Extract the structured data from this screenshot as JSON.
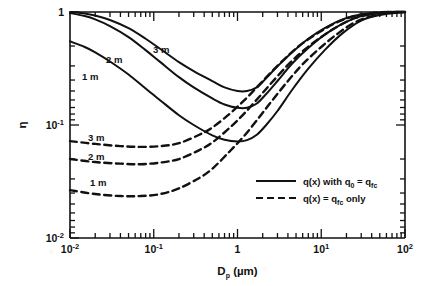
{
  "figure": {
    "background_color": "#ffffff",
    "ink_color": "#111111"
  },
  "chart_data": {
    "type": "line",
    "title": "",
    "subtitle": "",
    "xlabel": "D_p (µm)",
    "ylabel": "η",
    "xscale": "log",
    "yscale": "log",
    "xlim": [
      0.01,
      100
    ],
    "ylim": [
      0.01,
      1
    ],
    "grid": false,
    "legend_position": "lower-right-inside",
    "xtick_labels": [
      "10⁻²",
      "10⁻¹",
      "1",
      "10¹",
      "10²"
    ],
    "xtick_values": [
      0.01,
      0.1,
      1,
      10,
      100
    ],
    "ytick_labels": [
      "10⁻²",
      "10⁻¹",
      "1"
    ],
    "ytick_values": [
      0.01,
      0.1,
      1
    ],
    "series": [
      {
        "name": "3 m",
        "style": "solid",
        "group": "q(x) with q0 = qfc",
        "label": "3 m",
        "x": [
          0.01,
          0.015,
          0.02,
          0.03,
          0.05,
          0.08,
          0.12,
          0.2,
          0.3,
          0.5,
          0.7,
          1.0,
          1.3,
          1.7,
          2.2,
          3.0,
          4.5,
          7.0,
          11,
          18,
          30,
          50,
          100
        ],
        "y": [
          1.0,
          0.97,
          0.93,
          0.85,
          0.72,
          0.58,
          0.47,
          0.36,
          0.3,
          0.245,
          0.215,
          0.2,
          0.2,
          0.215,
          0.26,
          0.33,
          0.44,
          0.58,
          0.72,
          0.86,
          0.95,
          0.99,
          1.0
        ]
      },
      {
        "name": "2 m",
        "style": "solid",
        "group": "q(x) with q0 = qfc",
        "label": "2 m",
        "x": [
          0.01,
          0.015,
          0.02,
          0.03,
          0.05,
          0.08,
          0.12,
          0.2,
          0.3,
          0.5,
          0.7,
          1.0,
          1.3,
          1.7,
          2.2,
          3.0,
          4.5,
          7.0,
          11,
          18,
          30,
          50,
          100
        ],
        "y": [
          0.98,
          0.92,
          0.86,
          0.75,
          0.6,
          0.46,
          0.36,
          0.265,
          0.215,
          0.172,
          0.152,
          0.142,
          0.142,
          0.155,
          0.188,
          0.245,
          0.35,
          0.48,
          0.63,
          0.79,
          0.92,
          0.975,
          1.0
        ]
      },
      {
        "name": "1 m",
        "style": "solid",
        "group": "q(x) with q0 = qfc",
        "label": "1 m",
        "x": [
          0.01,
          0.015,
          0.02,
          0.03,
          0.05,
          0.08,
          0.12,
          0.2,
          0.3,
          0.5,
          0.7,
          1.0,
          1.3,
          1.7,
          2.2,
          3.0,
          4.5,
          7.0,
          11,
          18,
          30,
          50,
          100
        ],
        "y": [
          0.55,
          0.49,
          0.44,
          0.365,
          0.28,
          0.21,
          0.165,
          0.122,
          0.1,
          0.081,
          0.074,
          0.0715,
          0.0735,
          0.082,
          0.1,
          0.133,
          0.205,
          0.315,
          0.46,
          0.65,
          0.84,
          0.94,
          1.0
        ]
      },
      {
        "name": "3 m",
        "style": "dashed",
        "group": "q(x) = qfc only",
        "label": "3 m",
        "x": [
          0.01,
          0.02,
          0.04,
          0.07,
          0.12,
          0.2,
          0.35,
          0.5,
          0.8,
          1.2,
          1.8,
          2.6,
          4.0,
          6.0,
          10,
          16,
          26,
          45,
          70,
          100
        ],
        "y": [
          0.072,
          0.068,
          0.065,
          0.064,
          0.065,
          0.069,
          0.082,
          0.095,
          0.125,
          0.165,
          0.225,
          0.3,
          0.41,
          0.53,
          0.68,
          0.82,
          0.93,
          0.985,
          1.0,
          1.0
        ]
      },
      {
        "name": "2 m",
        "style": "dashed",
        "group": "q(x) = qfc only",
        "label": "2 m",
        "x": [
          0.01,
          0.02,
          0.04,
          0.07,
          0.12,
          0.2,
          0.35,
          0.5,
          0.8,
          1.2,
          1.8,
          2.6,
          4.0,
          6.0,
          10,
          16,
          26,
          45,
          70,
          100
        ],
        "y": [
          0.05,
          0.047,
          0.0455,
          0.045,
          0.0465,
          0.05,
          0.06,
          0.07,
          0.094,
          0.126,
          0.176,
          0.24,
          0.34,
          0.45,
          0.6,
          0.75,
          0.89,
          0.97,
          1.0,
          1.0
        ]
      },
      {
        "name": "1 m",
        "style": "dashed",
        "group": "q(x) = qfc only",
        "label": "1 m",
        "x": [
          0.01,
          0.02,
          0.04,
          0.07,
          0.12,
          0.2,
          0.35,
          0.5,
          0.8,
          1.2,
          1.8,
          2.6,
          4.0,
          6.0,
          10,
          16,
          26,
          45,
          70,
          100
        ],
        "y": [
          0.0265,
          0.0245,
          0.0235,
          0.0235,
          0.0245,
          0.0275,
          0.034,
          0.041,
          0.058,
          0.08,
          0.116,
          0.165,
          0.245,
          0.345,
          0.49,
          0.65,
          0.82,
          0.94,
          0.99,
          1.0
        ]
      }
    ],
    "annotations": [
      {
        "text": "3 m",
        "x": 0.13,
        "y": 0.4,
        "series": "solid-3m"
      },
      {
        "text": "2 m",
        "x": 0.05,
        "y": 0.335,
        "series": "solid-2m"
      },
      {
        "text": "1 m",
        "x": 0.024,
        "y": 0.255,
        "series": "solid-1m"
      },
      {
        "text": "3 m",
        "x": 0.027,
        "y": 0.085,
        "series": "dashed-3m"
      },
      {
        "text": "2 m",
        "x": 0.027,
        "y": 0.059,
        "series": "dashed-2m"
      },
      {
        "text": "1 m",
        "x": 0.03,
        "y": 0.0315,
        "series": "dashed-1m"
      }
    ],
    "legend": [
      {
        "style": "solid",
        "text_plain": "q(x) with q0 = qfc"
      },
      {
        "style": "dashed",
        "text_plain": "q(x) = qfc only"
      }
    ]
  },
  "axis": {
    "x": {
      "label_main": "D",
      "label_sub": "p",
      "label_unit": "(µm)",
      "ticks": [
        {
          "base": "10",
          "exp": "-2"
        },
        {
          "base": "10",
          "exp": "-1"
        },
        {
          "base": "1",
          "exp": ""
        },
        {
          "base": "10",
          "exp": "1"
        },
        {
          "base": "10",
          "exp": "2"
        }
      ]
    },
    "y": {
      "label": "η",
      "ticks": [
        {
          "base": "1",
          "exp": ""
        },
        {
          "base": "10",
          "exp": "-1"
        },
        {
          "base": "10",
          "exp": "-2"
        }
      ]
    }
  },
  "legend": {
    "solid": {
      "prefix": "q(x) with q",
      "sub1": "0",
      "mid": " = q",
      "sub2": "fc",
      "suffix": ""
    },
    "dashed": {
      "prefix": "q(x) = q",
      "sub1": "fc",
      "mid": " only",
      "sub2": "",
      "suffix": ""
    }
  },
  "curve_labels": {
    "solid_3m": "3 m",
    "solid_2m": "2 m",
    "solid_1m": "1 m",
    "dashed_3m": "3 m",
    "dashed_2m": "2 m",
    "dashed_1m": "1 m"
  }
}
